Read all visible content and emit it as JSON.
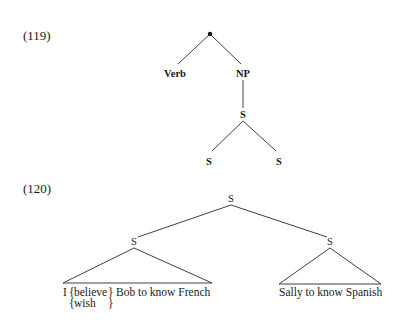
{
  "examples": [
    {
      "number": "(119)",
      "tree": {
        "root": {
          "label": "",
          "shape": "dot"
        },
        "nodes": {
          "verb": "Verb",
          "np": "NP",
          "s_mid": "S",
          "s_left": "S",
          "s_right": "S"
        }
      }
    },
    {
      "number": "(120)",
      "tree": {
        "nodes": {
          "s_top": "S",
          "s_left": "S",
          "s_right": "S"
        },
        "leaves": {
          "left_pre": "I",
          "left_option_1": "believe",
          "left_option_2": "wish",
          "left_post": "Bob to know French",
          "right": "Sally to know Spanish"
        }
      }
    }
  ]
}
